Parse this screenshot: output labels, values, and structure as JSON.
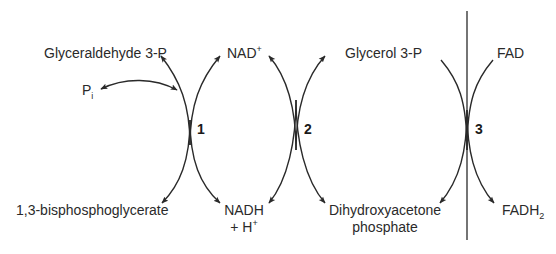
{
  "diagram": {
    "reaction_1": {
      "number": "1",
      "top_left": "Glyceraldehyde 3-P",
      "side": {
        "base": "P",
        "sub": "i"
      },
      "top_right": {
        "base": "NAD",
        "sup": "+"
      },
      "bottom_left": "1,3-bisphosphoglycerate",
      "bottom_right": {
        "line1": "NADH",
        "line2_base": "+ H",
        "line2_sup": "+"
      }
    },
    "reaction_2": {
      "number": "2",
      "top_right": "Glycerol 3-P",
      "bottom_right": {
        "line1": "Dihydroxyacetone",
        "line2": "phosphate"
      }
    },
    "reaction_3": {
      "number": "3",
      "top_right": "FAD",
      "bottom_right": {
        "base": "FADH",
        "sub": "2"
      }
    },
    "colors": {
      "line": "#2a2a2a",
      "text": "#2a2a2a",
      "background": "#ffffff"
    }
  }
}
